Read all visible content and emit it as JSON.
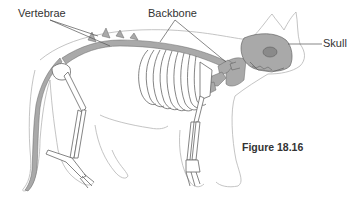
{
  "figure": {
    "caption": "Figure 18.16",
    "labels": {
      "vertebrae": "Vertebrae",
      "backbone": "Backbone",
      "skull": "Skull"
    },
    "colors": {
      "bone_fill": "#a9a9a9",
      "outline": "#9a9a9a",
      "line": "#555555",
      "text": "#333333"
    }
  }
}
